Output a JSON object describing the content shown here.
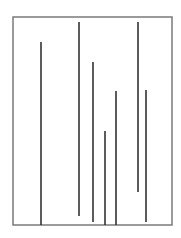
{
  "diagram": {
    "type": "vertical-line-segments-in-frame",
    "canvas": {
      "width": 181,
      "height": 238,
      "background": "#ffffff"
    },
    "frame": {
      "x1": 13,
      "y1": 17,
      "x2": 172,
      "y2": 225,
      "stroke": "#7a7a7a",
      "stroke_width": 1.5
    },
    "line_style": {
      "stroke": "#333333",
      "stroke_width": 1.6
    },
    "segments": [
      {
        "id": 1,
        "x": 41,
        "y_top": 42,
        "y_bottom": 225
      },
      {
        "id": 2,
        "x": 79,
        "y_top": 22,
        "y_bottom": 216
      },
      {
        "id": 3,
        "x": 93,
        "y_top": 62,
        "y_bottom": 222
      },
      {
        "id": 4,
        "x": 105,
        "y_top": 131,
        "y_bottom": 225
      },
      {
        "id": 5,
        "x": 116,
        "y_top": 91,
        "y_bottom": 225
      },
      {
        "id": 6,
        "x": 138,
        "y_top": 22,
        "y_bottom": 192
      },
      {
        "id": 7,
        "x": 146,
        "y_top": 90,
        "y_bottom": 222
      }
    ]
  }
}
